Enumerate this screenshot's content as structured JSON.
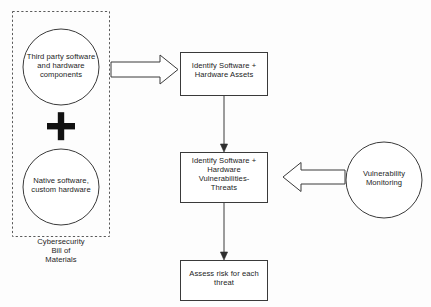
{
  "diagram": {
    "colors": {
      "stroke": "#3a3a3a",
      "dashed_group_stroke": "#5a5a5a",
      "background": "#fdfdfd",
      "text": "#1c1c1c",
      "plus_fill": "#111111"
    },
    "group": {
      "caption": "Cybersecurity\nBill of\nMaterials",
      "style": "dashed-rectangle"
    },
    "nodes": [
      {
        "id": "third-party",
        "shape": "circle",
        "label": "Third party software\nand hardware\ncomponents"
      },
      {
        "id": "plus",
        "shape": "plus-sign",
        "label": "+"
      },
      {
        "id": "native",
        "shape": "circle",
        "label": "Native software,\ncustom hardware"
      },
      {
        "id": "identify-assets",
        "shape": "rectangle",
        "label": "Identify Software +\nHardware Assets"
      },
      {
        "id": "identify-vulns",
        "shape": "rectangle",
        "label": "Identify Software +\nHardware\nVulnerabilities-\nThreats"
      },
      {
        "id": "assess-risk",
        "shape": "rectangle",
        "label": "Assess risk for each\nthreat"
      },
      {
        "id": "vulnerability-monitoring",
        "shape": "circle",
        "label": "Vulnerability\nMonitoring"
      }
    ],
    "edges": [
      {
        "id": "cbom-to-assets",
        "from": "cybersecurity-bill-of-materials",
        "to": "identify-assets",
        "style": "block-arrow",
        "direction": "right"
      },
      {
        "id": "assets-to-vulns",
        "from": "identify-assets",
        "to": "identify-vulns",
        "style": "line-arrow",
        "direction": "down"
      },
      {
        "id": "vulns-to-risk",
        "from": "identify-vulns",
        "to": "assess-risk",
        "style": "line-arrow",
        "direction": "down"
      },
      {
        "id": "monitoring-to-vulns",
        "from": "vulnerability-monitoring",
        "to": "identify-vulns",
        "style": "block-arrow",
        "direction": "left"
      }
    ]
  }
}
